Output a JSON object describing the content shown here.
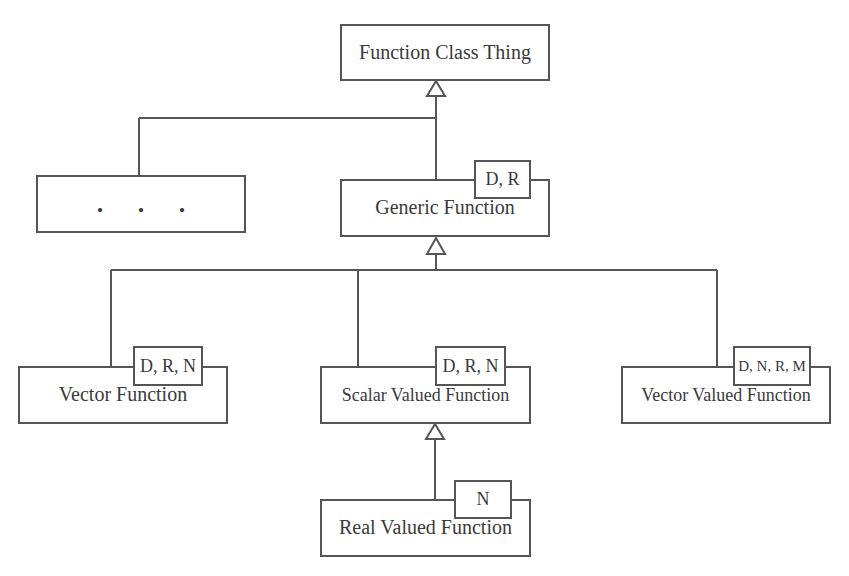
{
  "diagram": {
    "type": "uml-class-hierarchy",
    "line_color": "#555555",
    "nodes": {
      "root": {
        "label": "Function Class Thing"
      },
      "ellipsis": {
        "label": ". . ."
      },
      "generic": {
        "label": "Generic Function",
        "params": "D, R"
      },
      "vector": {
        "label": "Vector Function",
        "params": "D, R, N"
      },
      "scalar": {
        "label": "Scalar Valued Function",
        "params": "D, R, N"
      },
      "vector_valued": {
        "label": "Vector Valued Function",
        "params": "D, N, R, M"
      },
      "real": {
        "label": "Real Valued Function",
        "params": "N"
      }
    },
    "edges": [
      {
        "from": "ellipsis",
        "to": "root",
        "kind": "generalization"
      },
      {
        "from": "generic",
        "to": "root",
        "kind": "generalization"
      },
      {
        "from": "vector",
        "to": "generic",
        "kind": "generalization"
      },
      {
        "from": "scalar",
        "to": "generic",
        "kind": "generalization"
      },
      {
        "from": "vector_valued",
        "to": "generic",
        "kind": "generalization"
      },
      {
        "from": "real",
        "to": "scalar",
        "kind": "generalization"
      }
    ]
  }
}
